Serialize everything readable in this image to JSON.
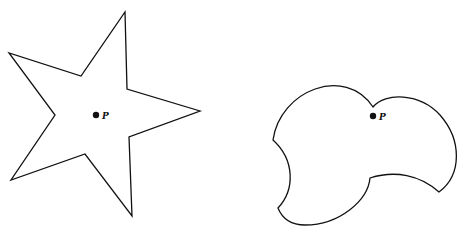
{
  "diagram": {
    "type": "geometry-figure",
    "figures": [
      {
        "name": "star-polygon",
        "point_label": "P"
      },
      {
        "name": "curved-star-shaped-region",
        "point_label": "P"
      }
    ]
  }
}
